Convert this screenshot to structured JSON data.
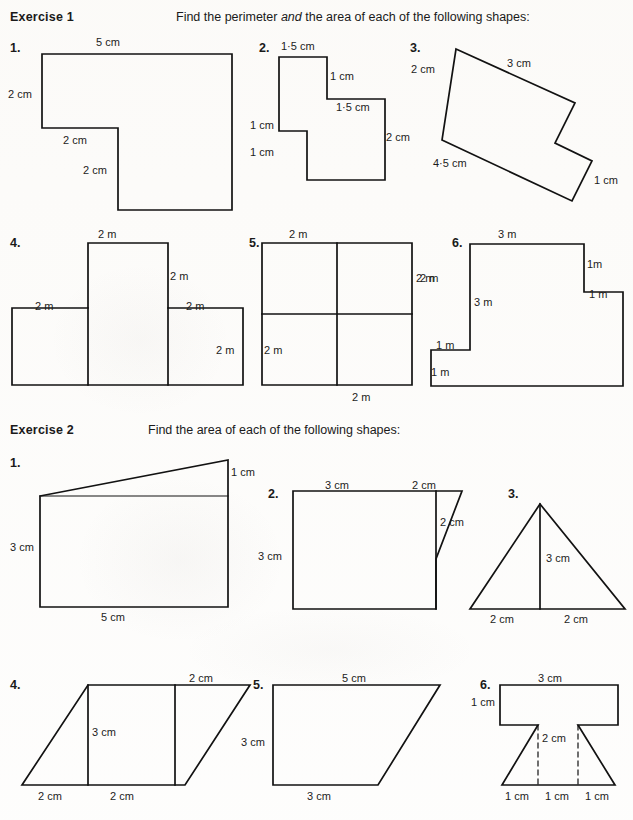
{
  "page": {
    "width": 633,
    "height": 820,
    "background": "#fefefe",
    "ink": "#121212"
  },
  "exercise1": {
    "heading": "Exercise 1",
    "instruction_pre": "Find the perimeter ",
    "instruction_em": "and",
    "instruction_post": " the area of each of the following shapes:",
    "instruction_full": "Find the perimeter and the area of each of the following shapes:",
    "questions": [
      {
        "number": "1.",
        "shape": "L-shape rectilinear",
        "labels": [
          "5 cm",
          "2 cm",
          "2 cm",
          "2 cm"
        ],
        "label_top": "5 cm",
        "label_left": "2 cm",
        "label_inner_horizontal": "2 cm",
        "label_inner_vertical": "2 cm"
      },
      {
        "number": "2.",
        "shape": "staircase rectilinear",
        "labels": [
          "1·5 cm",
          "1 cm",
          "1·5 cm",
          "2 cm",
          "1 cm",
          "1 cm"
        ],
        "label_top": "1·5 cm",
        "label_right_upper": "1 cm",
        "label_step": "1·5 cm",
        "label_right_lower": "2 cm",
        "label_left_upper": "1 cm",
        "label_left_lower": "1 cm"
      },
      {
        "number": "3.",
        "shape": "rotated rectilinear hexagon",
        "labels": [
          "2 cm",
          "3 cm",
          "4·5 cm",
          "1 cm"
        ],
        "label_upper_left": "2 cm",
        "label_top": "3 cm",
        "label_bottom": "4·5 cm",
        "label_right": "1 cm"
      },
      {
        "number": "4.",
        "shape": "T-shape of three squares plus stem",
        "labels": [
          "2 m",
          "2 m",
          "2 m",
          "2 m",
          "2 m"
        ],
        "label_top": "2 m",
        "label_stem_right": "2 m",
        "label_left": "2 m",
        "label_right_top": "2 m",
        "label_right_lower": "2 m"
      },
      {
        "number": "5.",
        "shape": "square divided into four equal squares",
        "labels": [
          "2 m",
          "2 m",
          "2 m",
          "2 m"
        ],
        "label_top": "2 m",
        "label_right": "2 m",
        "label_left": "2 m",
        "label_bottom": "2 m"
      },
      {
        "number": "6.",
        "shape": "stepped rectilinear",
        "labels": [
          "3 m",
          "1m",
          "2 m",
          "1 m",
          "3 m",
          "1 m",
          "1 m"
        ],
        "label_top": "3 m",
        "label_step_right_upper": "1m",
        "label_step_right_lower": "1 m",
        "label_outer_left": "2 m",
        "label_inner_left": "3 m",
        "label_step_left_upper": "1 m",
        "label_step_left_lower": "1 m"
      }
    ]
  },
  "exercise2": {
    "heading": "Exercise 2",
    "instruction_full": "Find the area of each of the following shapes:",
    "questions": [
      {
        "number": "1.",
        "shape": "rectangle with triangle on top",
        "labels": [
          "1 cm",
          "3 cm",
          "5 cm"
        ],
        "label_right": "1 cm",
        "label_left": "3 cm",
        "label_bottom": "5 cm"
      },
      {
        "number": "2.",
        "shape": "square with attached right triangle",
        "labels": [
          "3 cm",
          "2 cm",
          "2 cm",
          "3 cm"
        ],
        "label_top_left": "3 cm",
        "label_top_right": "2 cm",
        "label_inner_right": "2 cm",
        "label_left": "3 cm"
      },
      {
        "number": "3.",
        "shape": "triangle with vertical height line",
        "labels": [
          "3 cm",
          "2 cm",
          "2 cm"
        ],
        "label_height": "3 cm",
        "label_base_left": "2 cm",
        "label_base_right": "2 cm"
      },
      {
        "number": "4.",
        "shape": "parallelogram with two internal vertical lines",
        "labels": [
          "2 cm",
          "3 cm",
          "2 cm",
          "2 cm"
        ],
        "label_top_right": "2 cm",
        "label_height": "3 cm",
        "label_base_left": "2 cm",
        "label_base_right": "2 cm"
      },
      {
        "number": "5.",
        "shape": "right trapezium",
        "labels": [
          "5 cm",
          "3 cm",
          "3 cm"
        ],
        "label_top": "5 cm",
        "label_left": "3 cm",
        "label_bottom": "3 cm"
      },
      {
        "number": "6.",
        "shape": "T-shape over trapezium with dashed height lines",
        "labels": [
          "3 cm",
          "1 cm",
          "2 cm",
          "1 cm",
          "1 cm",
          "1 cm"
        ],
        "label_top": "3 cm",
        "label_left": "1 cm",
        "label_height": "2 cm",
        "label_base_left": "1 cm",
        "label_base_mid": "1 cm",
        "label_base_right": "1 cm"
      }
    ]
  },
  "background_marks": [
    {
      "text": ""
    }
  ]
}
